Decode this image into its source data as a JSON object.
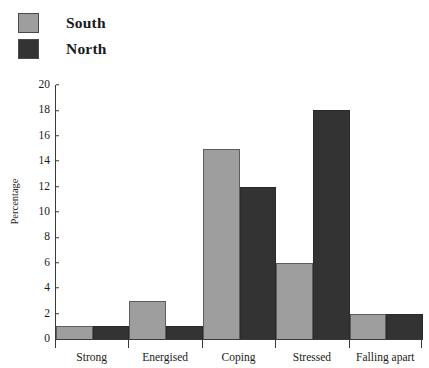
{
  "chart_data": {
    "type": "bar",
    "title": "",
    "xlabel": "",
    "ylabel": "Percentage",
    "ylim": [
      0,
      20
    ],
    "ytick_step": 2,
    "yticks": [
      20,
      18,
      16,
      14,
      12,
      10,
      8,
      6,
      4,
      2,
      0
    ],
    "grid": false,
    "legend_position": "top-left",
    "categories": [
      "Strong",
      "Energised",
      "Coping",
      "Stressed",
      "Falling apart"
    ],
    "series": [
      {
        "name": "South",
        "color": "#9e9e9e",
        "values": [
          1,
          3,
          15,
          6,
          2
        ]
      },
      {
        "name": "North",
        "color": "#333333",
        "values": [
          1,
          1,
          12,
          18,
          2
        ]
      }
    ]
  },
  "legend": {
    "items": [
      {
        "label": "South",
        "swatch": "legend-swatch-south"
      },
      {
        "label": "North",
        "swatch": "legend-swatch-north"
      }
    ]
  },
  "axis": {
    "y_title": "Percentage"
  }
}
